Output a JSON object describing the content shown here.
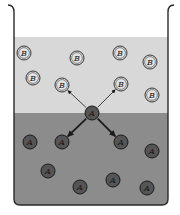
{
  "diagram": {
    "type": "diffusion-beaker",
    "colors": {
      "background": "#ffffff",
      "upper_liquid": "#d8d8d8",
      "lower_liquid": "#8c8c8c",
      "beaker_outline": "#2a2a2a",
      "particle_a_fill": "#555555",
      "particle_a_stroke": "#1a1a1a",
      "particle_b_fill": "#e2e2e2",
      "particle_b_stroke": "#222222",
      "arrow": "#1a1a1a"
    },
    "regions": {
      "upper": {
        "label": "B-rich layer",
        "top": 37,
        "bottom": 113
      },
      "lower": {
        "label": "A-rich layer",
        "top": 113,
        "bottom": 205
      }
    },
    "particles_b": [
      {
        "label": "B",
        "x": 24,
        "y": 53
      },
      {
        "label": "B",
        "x": 77,
        "y": 58
      },
      {
        "label": "B",
        "x": 120,
        "y": 53
      },
      {
        "label": "B",
        "x": 150,
        "y": 62
      },
      {
        "label": "B",
        "x": 33,
        "y": 78
      },
      {
        "label": "B",
        "x": 62,
        "y": 85
      },
      {
        "label": "B",
        "x": 121,
        "y": 84
      },
      {
        "label": "B",
        "x": 152,
        "y": 95
      }
    ],
    "particle_center": {
      "label": "A",
      "x": 92,
      "y": 113
    },
    "particles_a": [
      {
        "label": "A",
        "x": 30,
        "y": 142
      },
      {
        "label": "A",
        "x": 62,
        "y": 142
      },
      {
        "label": "A",
        "x": 121,
        "y": 142
      },
      {
        "label": "A",
        "x": 152,
        "y": 151
      },
      {
        "label": "A",
        "x": 48,
        "y": 171
      },
      {
        "label": "A",
        "x": 113,
        "y": 180
      },
      {
        "label": "A",
        "x": 80,
        "y": 187
      },
      {
        "label": "A",
        "x": 147,
        "y": 188
      }
    ],
    "arrows": [
      {
        "from": "center",
        "to": "B",
        "x": 62,
        "y": 85,
        "style": "thin"
      },
      {
        "from": "center",
        "to": "B",
        "x": 121,
        "y": 84,
        "style": "thin"
      },
      {
        "from": "center",
        "to": "A",
        "x": 62,
        "y": 142,
        "style": "thick"
      },
      {
        "from": "center",
        "to": "A",
        "x": 121,
        "y": 142,
        "style": "thick"
      }
    ]
  }
}
